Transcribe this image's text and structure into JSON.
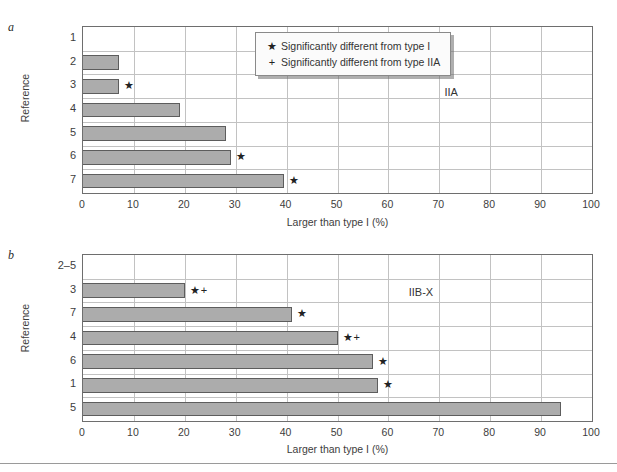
{
  "figure": {
    "legend": {
      "items": [
        {
          "symbol": "★",
          "label": "Significantly different from type I"
        },
        {
          "symbol": "+",
          "label": "Significantly different from type IIA"
        }
      ]
    },
    "footer_rule": true
  },
  "chart_data": [
    {
      "type": "bar",
      "panel_label": "a",
      "orientation": "horizontal",
      "title": "",
      "annotation": "IIA",
      "xlabel": "Larger than type I (%)",
      "ylabel": "Reference",
      "xlim": [
        0,
        100
      ],
      "xticks": [
        0,
        10,
        20,
        30,
        40,
        50,
        60,
        70,
        80,
        90,
        100
      ],
      "grid": "vertical-and-horizontal",
      "legend_position": "top-right-inside",
      "categories": [
        "1",
        "2",
        "3",
        "4",
        "5",
        "6",
        "7"
      ],
      "values": [
        0,
        7,
        7,
        19,
        28,
        29,
        39.5
      ],
      "point_annotations": [
        "",
        "",
        "★",
        "",
        "",
        "★",
        "★"
      ],
      "bar_color": "#acacac",
      "bar_edge_color": "#5d5d5d"
    },
    {
      "type": "bar",
      "panel_label": "b",
      "orientation": "horizontal",
      "title": "",
      "annotation": "IIB-X",
      "xlabel": "Larger than type I (%)",
      "ylabel": "Reference",
      "xlim": [
        0,
        100
      ],
      "xticks": [
        0,
        10,
        20,
        30,
        40,
        50,
        60,
        70,
        80,
        90,
        100
      ],
      "grid": "vertical-and-horizontal",
      "categories": [
        "2–5",
        "3",
        "7",
        "4",
        "6",
        "1",
        "5"
      ],
      "values": [
        0,
        20,
        41,
        50,
        57,
        58,
        94
      ],
      "point_annotations": [
        "",
        "★+",
        "★",
        "★+",
        "★",
        "★",
        ""
      ],
      "bar_color": "#acacac",
      "bar_edge_color": "#5d5d5d"
    }
  ]
}
